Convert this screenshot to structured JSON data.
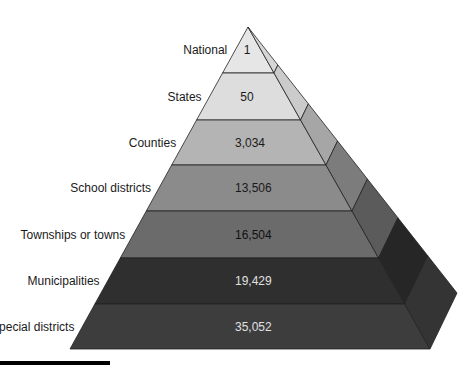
{
  "diagram": {
    "type": "pyramid",
    "levels": [
      {
        "label": "National",
        "value": "1",
        "front_color": "#e6e6e6",
        "side_color": "#d6d6d6",
        "text_color": "#1a1a1a"
      },
      {
        "label": "States",
        "value": "50",
        "front_color": "#dddddd",
        "side_color": "#cbcbcb",
        "text_color": "#1a1a1a"
      },
      {
        "label": "Counties",
        "value": "3,034",
        "front_color": "#b4b4b4",
        "side_color": "#a6a6a6",
        "text_color": "#1a1a1a"
      },
      {
        "label": "School districts",
        "value": "13,506",
        "front_color": "#8b8b8b",
        "side_color": "#7c7c7c",
        "text_color": "#1a1a1a"
      },
      {
        "label": "Townships or towns",
        "value": "16,504",
        "front_color": "#6b6b6b",
        "side_color": "#5b5b5b",
        "text_color": "#111111"
      },
      {
        "label": "Municipalities",
        "value": "19,429",
        "front_color": "#2f2f2f",
        "side_color": "#262626",
        "text_color": "#e0e0e0"
      },
      {
        "label": "Special districts",
        "value": "35,052",
        "front_color": "#3d3d3d",
        "side_color": "#343434",
        "text_color": "#e0e0e0"
      }
    ]
  },
  "chart_data": {
    "type": "pyramid",
    "title": "",
    "categories": [
      "National",
      "States",
      "Counties",
      "School districts",
      "Townships or towns",
      "Municipalities",
      "Special districts"
    ],
    "values": [
      1,
      50,
      3034,
      13506,
      16504,
      19429,
      35052
    ]
  }
}
